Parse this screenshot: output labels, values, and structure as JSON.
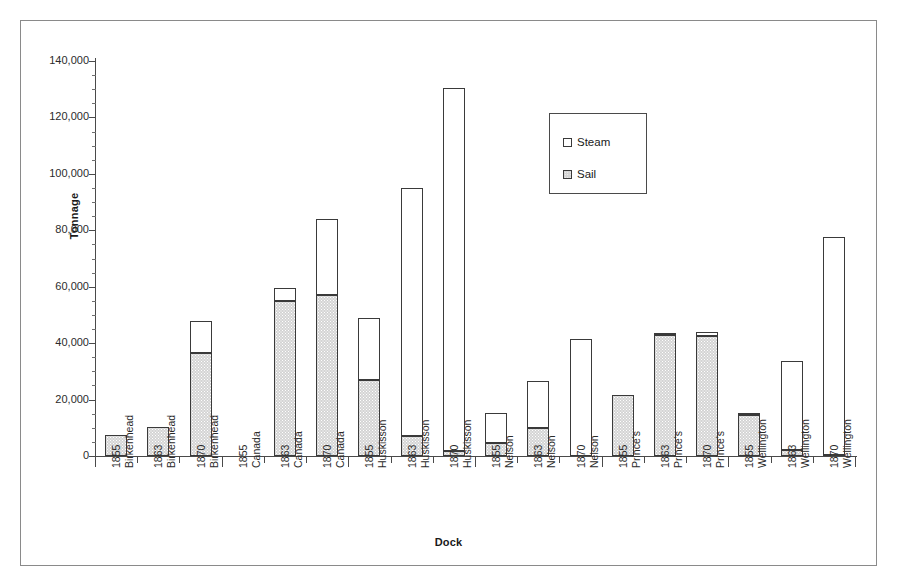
{
  "chart_data": {
    "type": "bar",
    "subtype": "stacked-bar",
    "title": "",
    "xlabel": "Dock",
    "ylabel": "Tonnage",
    "ylim": [
      0,
      140000
    ],
    "ytick_step": 20000,
    "ytick_labels": [
      "140,000",
      "120,000",
      "100,000",
      "80,000",
      "60,000",
      "40,000",
      "20,000",
      "0"
    ],
    "ytick_values": [
      140000,
      120000,
      100000,
      80000,
      60000,
      40000,
      20000,
      0
    ],
    "grid": false,
    "legend_position": "upper-center-right",
    "categories": [
      "1855 Birkenhead",
      "1863 Birkenhead",
      "1870 Birkenhead",
      "1855 Canada",
      "1863 Canada",
      "1870 Canada",
      "1855 Huskisson",
      "1863 Huskisson",
      "1870 Huskisson",
      "1855 Nelson",
      "1863 Nelson",
      "1870 Nelson",
      "1855 Prince's",
      "1863 Prince's",
      "1870 Prince's",
      "1855 Wellington",
      "1863 Wellington",
      "1870 Wellington"
    ],
    "category_years": [
      "1855",
      "1863",
      "1870",
      "1855",
      "1863",
      "1870",
      "1855",
      "1863",
      "1870",
      "1855",
      "1863",
      "1870",
      "1855",
      "1863",
      "1870",
      "1855",
      "1863",
      "1870"
    ],
    "category_docks": [
      "Birkenhead",
      "Birkenhead",
      "Birkenhead",
      "Canada",
      "Canada",
      "Canada",
      "Huskisson",
      "Huskisson",
      "Huskisson",
      "Nelson",
      "Nelson",
      "Nelson",
      "Prince's",
      "Prince's",
      "Prince's",
      "Wellington",
      "Wellington",
      "Wellington"
    ],
    "series": [
      {
        "name": "Sail",
        "color": "#d4d4d4",
        "values": [
          7300,
          10200,
          36500,
          0,
          55000,
          57200,
          27000,
          7200,
          1800,
          4500,
          9900,
          0,
          21800,
          43000,
          42600,
          14500,
          2000,
          500
        ]
      },
      {
        "name": "Steam",
        "color": "#ffffff",
        "values": [
          0,
          0,
          11500,
          0,
          4500,
          26800,
          22000,
          87800,
          128700,
          10700,
          16600,
          41500,
          0,
          200,
          1200,
          800,
          31500,
          77000
        ]
      }
    ],
    "totals": [
      7300,
      10200,
      48000,
      0,
      59500,
      84000,
      49000,
      95000,
      130500,
      15200,
      26500,
      41500,
      21800,
      43200,
      43800,
      15300,
      33500,
      77500
    ]
  },
  "legend": {
    "entries": [
      {
        "label": "Steam",
        "key": "steam"
      },
      {
        "label": "Sail",
        "key": "sail"
      }
    ]
  },
  "axes": {
    "y_title": "Tonnage",
    "x_title": "Dock"
  }
}
